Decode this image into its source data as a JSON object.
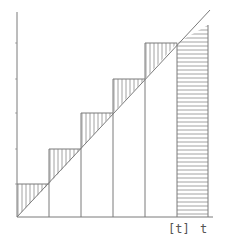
{
  "diagram": {
    "x_axis_label": "t",
    "floor_label": "[t]",
    "colors": {
      "line": "#7a7a7a",
      "hatch": "#8a8a8a",
      "text": "#555555"
    },
    "steps": [
      {
        "x0": 0,
        "x1": 1,
        "height": 1
      },
      {
        "x0": 1,
        "x1": 2,
        "height": 2
      },
      {
        "x0": 2,
        "x1": 3,
        "height": 3
      },
      {
        "x0": 3,
        "x1": 4,
        "height": 4
      },
      {
        "x0": 4,
        "x1": 5,
        "height": 5
      }
    ],
    "final_strip": {
      "from": "[t]",
      "to": "t",
      "hatch": "horizontal"
    }
  }
}
